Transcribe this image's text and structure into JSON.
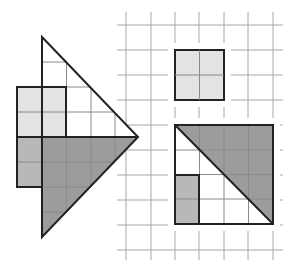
{
  "diagram": {
    "colors": {
      "background": "#ffffff",
      "grid_line": "#9a9a9a",
      "outline": "#222222",
      "light_fill": "#e3e3e3",
      "medium_fill": "#b8b8b8",
      "dark_fill": "#9c9c9c"
    },
    "cell_size_px": 24.5,
    "left_figure": {
      "triangle_vertices": [
        [
          42,
          37
        ],
        [
          138,
          137
        ],
        [
          42,
          237
        ]
      ],
      "light_square": {
        "x": 17,
        "y": 87,
        "w": 49,
        "h": 50,
        "cells": "2x2"
      },
      "medium_rect": {
        "x": 17,
        "y": 137,
        "w": 25,
        "h": 50,
        "cells": "1x2"
      },
      "dark_lower_triangle": [
        [
          42,
          137
        ],
        [
          138,
          137
        ],
        [
          42,
          237
        ]
      ]
    },
    "right_grid": {
      "x_lines": [
        126,
        151,
        175,
        199,
        224,
        248,
        273
      ],
      "y_lines": [
        25,
        50,
        75,
        100,
        125,
        150,
        175,
        200,
        225,
        250
      ],
      "small_square": {
        "x": 175,
        "y": 50,
        "w": 49,
        "h": 50,
        "cells": "2x2"
      },
      "big_square": {
        "x": 175,
        "y": 125,
        "w": 98,
        "h": 99,
        "cells": "4x4"
      },
      "dark_triangle": [
        [
          175,
          125
        ],
        [
          273,
          125
        ],
        [
          273,
          224
        ]
      ],
      "medium_rect": {
        "x": 175,
        "y": 175,
        "w": 24,
        "h": 49,
        "cells": "1x2"
      }
    }
  }
}
